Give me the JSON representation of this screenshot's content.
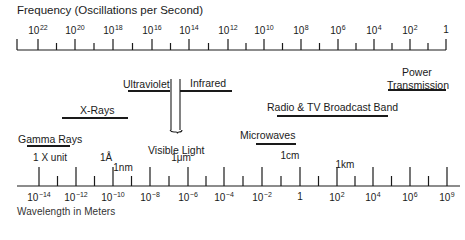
{
  "top_axis": {
    "title": "Frequency (Oscillations per Second)",
    "labels": [
      {
        "base": "10",
        "exp": "22",
        "x": 38
      },
      {
        "base": "10",
        "exp": "20",
        "x": 75
      },
      {
        "base": "10",
        "exp": "18",
        "x": 113
      },
      {
        "base": "10",
        "exp": "16",
        "x": 152
      },
      {
        "base": "10",
        "exp": "14",
        "x": 189
      },
      {
        "base": "10",
        "exp": "12",
        "x": 228
      },
      {
        "base": "10",
        "exp": "10",
        "x": 264
      },
      {
        "base": "10",
        "exp": "8",
        "x": 301
      },
      {
        "base": "10",
        "exp": "6",
        "x": 338
      },
      {
        "base": "10",
        "exp": "4",
        "x": 374
      },
      {
        "base": "10",
        "exp": "2",
        "x": 410
      },
      {
        "base": "1",
        "exp": "",
        "x": 446
      }
    ]
  },
  "bands": [
    {
      "name": "Gamma Rays",
      "label_x": 18,
      "label_y": 73,
      "bar_x1": 27,
      "bar_x2": 70,
      "bar_y": 85
    },
    {
      "name": "X-Rays",
      "label_x": 80,
      "label_y": 44,
      "bar_x1": 62,
      "bar_x2": 128,
      "bar_y": 57
    },
    {
      "name": "Ultraviolet",
      "label_x": 123,
      "label_y": 18,
      "bar_x1": 128,
      "bar_x2": 170,
      "bar_y": 30
    },
    {
      "name": "Infrared",
      "label_x": 190,
      "label_y": 17,
      "bar_x1": 180,
      "bar_x2": 232,
      "bar_y": 30
    },
    {
      "name": "Visible Light",
      "label_x": 148,
      "label_y": 84
    },
    {
      "name": "Microwaves",
      "label_x": 240,
      "label_y": 69,
      "bar_x1": 256,
      "bar_x2": 296,
      "bar_y": 83
    },
    {
      "name": "Radio & TV Broadcast Band",
      "label_x": 267,
      "label_y": 41,
      "bar_x1": 277,
      "bar_x2": 388,
      "bar_y": 55
    },
    {
      "name": "Power",
      "label_x": 402,
      "label_y": 6
    },
    {
      "name": "Transmission",
      "label_x": 387,
      "label_y": 19,
      "bar_x1": 388,
      "bar_x2": 446,
      "bar_y": 29
    }
  ],
  "bottom_axis": {
    "title": "Wavelength in Meters",
    "labels": [
      {
        "base": "10",
        "exp": "−14",
        "x": 39
      },
      {
        "base": "10",
        "exp": "−12",
        "x": 76
      },
      {
        "base": "10",
        "exp": "−10",
        "x": 113
      },
      {
        "base": "10",
        "exp": "−8",
        "x": 150
      },
      {
        "base": "10",
        "exp": "−6",
        "x": 188
      },
      {
        "base": "10",
        "exp": "−4",
        "x": 224
      },
      {
        "base": "10",
        "exp": "−2",
        "x": 262
      },
      {
        "base": "1",
        "exp": "",
        "x": 300
      },
      {
        "base": "10",
        "exp": "2",
        "x": 337
      },
      {
        "base": "10",
        "exp": "4",
        "x": 373
      },
      {
        "base": "10",
        "exp": "6",
        "x": 410
      },
      {
        "base": "10",
        "exp": "9",
        "x": 447
      }
    ],
    "unit_markers": [
      {
        "label": "1 X unit",
        "x": 50,
        "y": 152
      },
      {
        "label": "1Å",
        "x": 106,
        "y": 152
      },
      {
        "label": "1nm",
        "x": 123,
        "y": 162
      },
      {
        "label": "1μm",
        "x": 181,
        "y": 152
      },
      {
        "label": "1cm",
        "x": 290,
        "y": 150
      },
      {
        "label": "1km",
        "x": 345,
        "y": 159
      }
    ]
  },
  "chart_data": {
    "type": "table",
    "top_axis_label": "Frequency (Oscillations per Second)",
    "bottom_axis_label": "Wavelength in Meters",
    "frequency_ticks": [
      "10^22",
      "10^20",
      "10^18",
      "10^16",
      "10^14",
      "10^12",
      "10^10",
      "10^8",
      "10^6",
      "10^4",
      "10^2",
      "1"
    ],
    "wavelength_ticks": [
      "10^-14",
      "10^-12",
      "10^-10",
      "10^-8",
      "10^-6",
      "10^-4",
      "10^-2",
      "1",
      "10^2",
      "10^4",
      "10^6",
      "10^9"
    ],
    "wavelength_units": [
      "1 X unit",
      "1Å",
      "1nm",
      "1μm",
      "1cm",
      "1km"
    ],
    "bands": [
      "Gamma Rays",
      "X-Rays",
      "Ultraviolet",
      "Visible Light",
      "Infrared",
      "Microwaves",
      "Radio & TV Broadcast Band",
      "Power Transmission"
    ]
  }
}
